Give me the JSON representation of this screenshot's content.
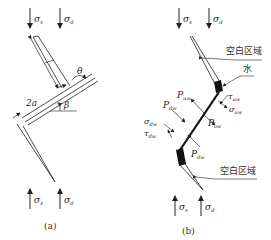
{
  "panels": [
    {
      "id": "a",
      "caption": "(a)",
      "stress_top": [
        {
          "sym": "σ",
          "sub": "s"
        },
        {
          "sym": "σ",
          "sub": "d"
        }
      ],
      "stress_bottom": [
        {
          "sym": "σ",
          "sub": "s"
        },
        {
          "sym": "σ",
          "sub": "d"
        }
      ],
      "dim_label": "2a",
      "angle_theta": "θ",
      "angle_beta": "β"
    },
    {
      "id": "b",
      "caption": "(b)",
      "stress_top": [
        {
          "sym": "σ",
          "sub": "s"
        },
        {
          "sym": "σ",
          "sub": "d"
        }
      ],
      "stress_bottom": [
        {
          "sym": "σ",
          "sub": "s"
        },
        {
          "sym": "σ",
          "sub": "d"
        }
      ],
      "callouts": {
        "empty_top": "空白区域",
        "water": "水",
        "empty_bottom": "空白区域"
      },
      "forces": {
        "P_uw": {
          "sym": "P",
          "sub": "uw"
        },
        "P_dw_left": {
          "sym": "P",
          "sub": "dw"
        },
        "P_ow": {
          "sym": "P",
          "sub": "ow"
        },
        "P_dw_bottom": {
          "sym": "P",
          "sub": "dw"
        },
        "sigma_dw": {
          "sym": "σ",
          "sub": "dw"
        },
        "tau_dw": {
          "sym": "τ",
          "sub": "dw"
        },
        "tau_uw": {
          "sym": "τ",
          "sub": "uw"
        },
        "sigma_uw": {
          "sym": "σ",
          "sub": "uw"
        }
      }
    }
  ]
}
